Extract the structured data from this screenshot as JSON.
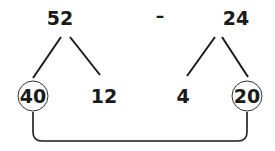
{
  "expression": {
    "left": "52",
    "operator": "–",
    "right": "24"
  },
  "left_split": {
    "tens": "40",
    "ones": "12"
  },
  "right_split": {
    "ones": "4",
    "tens": "20"
  },
  "connector": "40 linked to 20"
}
